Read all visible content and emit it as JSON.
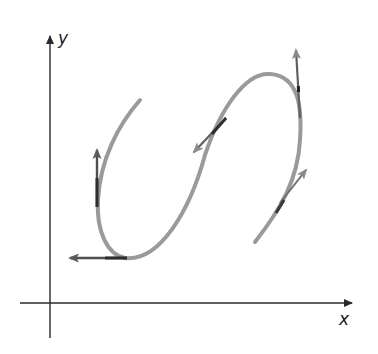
{
  "figure": {
    "x_axis_label": "x",
    "y_axis_label": "y",
    "colors": {
      "axis": "#2a2a2a",
      "curve": "#9a9a9a",
      "tangent": "#555555",
      "tangent_highlight": "#2e2e2e"
    },
    "tangent_vectors": [
      {
        "name": "up-left",
        "direction": "up"
      },
      {
        "name": "bottom",
        "direction": "left"
      },
      {
        "name": "middle",
        "direction": "down-left"
      },
      {
        "name": "upper-right",
        "direction": "up"
      },
      {
        "name": "lower-right",
        "direction": "up-right"
      }
    ]
  }
}
